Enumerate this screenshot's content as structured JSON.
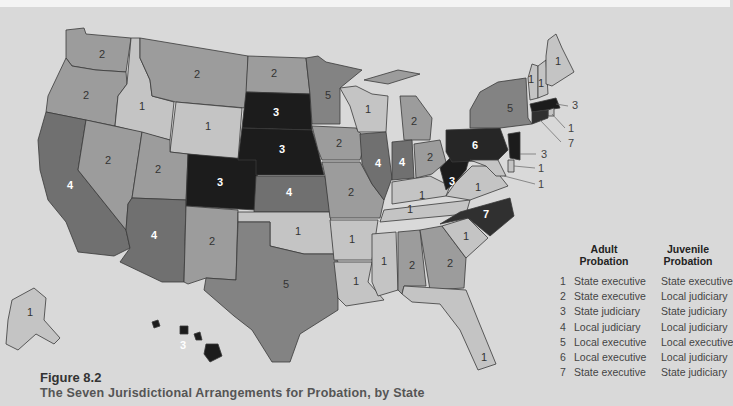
{
  "figure": {
    "number": "Figure 8.2",
    "title": "The Seven Jurisdictional Arrangements for Probation, by State"
  },
  "legend": {
    "adult_header": "Adult Probation",
    "adult_header_line1": "Adult",
    "adult_header_line2": "Probation",
    "juvenile_header_line1": "Juvenile",
    "juvenile_header_line2": "Probation",
    "rows": [
      {
        "code": "1",
        "adult": "State executive",
        "juvenile": "State executive"
      },
      {
        "code": "2",
        "adult": "State executive",
        "juvenile": "Local judiciary"
      },
      {
        "code": "3",
        "adult": "State judiciary",
        "juvenile": "State judiciary"
      },
      {
        "code": "4",
        "adult": "Local judiciary",
        "juvenile": "Local judiciary"
      },
      {
        "code": "5",
        "adult": "Local executive",
        "juvenile": "Local executive"
      },
      {
        "code": "6",
        "adult": "Local executive",
        "juvenile": "Local judiciary"
      },
      {
        "code": "7",
        "adult": "State executive",
        "juvenile": "State judiciary"
      }
    ]
  },
  "category_colors": {
    "1": "#c4c4c4",
    "2": "#9c9c9c",
    "3": "#1c1c1c",
    "4": "#707070",
    "5": "#838383",
    "6": "#262626",
    "7": "#303030"
  },
  "states": {
    "WA": "2",
    "OR": "2",
    "CA": "4",
    "ID": "1",
    "NV": "2",
    "MT": "2",
    "WY": "1",
    "UT": "2",
    "AZ": "4",
    "CO": "3",
    "NM": "2",
    "ND": "2",
    "SD": "3",
    "NE": "3",
    "KS": "4",
    "OK": "1",
    "TX": "5",
    "MN": "5",
    "IA": "2",
    "MO": "2",
    "AR": "1",
    "LA": "1",
    "WI": "1",
    "IL": "4",
    "MI": "2",
    "IN": "4",
    "OH": "2",
    "KY": "1",
    "TN": "1",
    "MS": "1",
    "AL": "2",
    "GA": "2",
    "FL": "1",
    "SC": "1",
    "NC": "7",
    "VA": "1",
    "WV": "3",
    "PA": "6",
    "NY": "5",
    "VT": "1",
    "NH": "1",
    "ME": "1",
    "MA": "3",
    "RI": "1",
    "CT": "7",
    "NJ": "3",
    "DE": "1",
    "MD": "1",
    "AK": "1",
    "HI": "3"
  }
}
